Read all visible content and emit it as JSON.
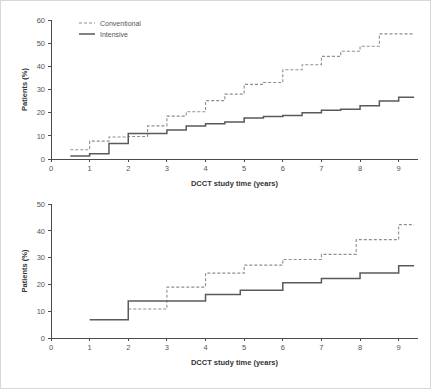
{
  "figure": {
    "background": "#ffffff",
    "border_color": "#d8d8d8",
    "axis_color": "#4a4a4a",
    "intensive_color": "#5a5a5a",
    "conventional_color": "#8e8e8e"
  },
  "legend": {
    "conventional_label": "Conventional",
    "intensive_label": "Intensive"
  },
  "chart_data": [
    {
      "id": "top",
      "type": "line",
      "title": "",
      "subtitle": "",
      "xlabel": "DCCT study time (years)",
      "ylabel": "Patients (%)",
      "xlim": [
        0,
        9.5
      ],
      "ylim": [
        0,
        60
      ],
      "xticks": [
        0,
        1,
        2,
        3,
        4,
        5,
        6,
        7,
        8,
        9
      ],
      "xticklabels": [
        "0",
        "1",
        "2",
        "3",
        "4",
        "5",
        "6",
        "7",
        "8",
        "9"
      ],
      "yticks": [
        0,
        10,
        20,
        30,
        40,
        50,
        60
      ],
      "yticklabels": [
        "0",
        "10",
        "20",
        "30",
        "40",
        "50",
        "60"
      ],
      "grid": false,
      "legend_position": "top-left",
      "annotations": [],
      "series": [
        {
          "name": "Conventional",
          "style": "dashed",
          "color": "#8e8e8e",
          "step": "post",
          "x": [
            0.5,
            1.0,
            1.5,
            2.0,
            2.5,
            3.0,
            3.5,
            4.0,
            4.5,
            5.0,
            5.5,
            6.0,
            6.5,
            7.0,
            7.5,
            8.0,
            8.5,
            9.0,
            9.4
          ],
          "y": [
            4.0,
            7.7,
            9.5,
            9.7,
            14.3,
            18.5,
            20.4,
            25.2,
            28.0,
            32.2,
            33.0,
            38.5,
            40.7,
            44.3,
            46.5,
            48.7,
            54.0,
            54.0,
            54.0
          ]
        },
        {
          "name": "Intensive",
          "style": "solid",
          "color": "#5a5a5a",
          "step": "post",
          "x": [
            0.5,
            1.0,
            1.5,
            2.0,
            2.5,
            3.0,
            3.5,
            4.0,
            4.5,
            5.0,
            5.5,
            6.0,
            6.5,
            7.0,
            7.5,
            8.0,
            8.5,
            9.0,
            9.4
          ],
          "y": [
            1.3,
            2.3,
            6.7,
            11.0,
            11.0,
            12.5,
            14.2,
            15.2,
            16.0,
            17.7,
            18.3,
            18.8,
            20.0,
            21.0,
            21.5,
            23.0,
            25.0,
            26.7,
            26.7
          ]
        }
      ]
    },
    {
      "id": "bottom",
      "type": "line",
      "title": "",
      "subtitle": "",
      "xlabel": "DCCT study time (years)",
      "ylabel": "Patients (%)",
      "xlim": [
        0,
        9.5
      ],
      "ylim": [
        0,
        50
      ],
      "xticks": [
        0,
        1,
        2,
        3,
        4,
        5,
        6,
        7,
        8,
        9
      ],
      "xticklabels": [
        "0",
        "1",
        "2",
        "3",
        "4",
        "5",
        "6",
        "7",
        "8",
        "9"
      ],
      "yticks": [
        0,
        10,
        20,
        30,
        40,
        50
      ],
      "yticklabels": [
        "0",
        "10",
        "20",
        "30",
        "40",
        "50"
      ],
      "grid": false,
      "legend_position": "none",
      "annotations": [],
      "series": [
        {
          "name": "Conventional",
          "style": "dashed",
          "color": "#8e8e8e",
          "step": "post",
          "x": [
            2.0,
            3.0,
            4.0,
            5.0,
            6.0,
            7.0,
            7.9,
            9.0,
            9.4
          ],
          "y": [
            10.8,
            19.0,
            24.2,
            27.2,
            29.3,
            31.2,
            36.7,
            42.3,
            42.3
          ]
        },
        {
          "name": "Intensive",
          "style": "solid",
          "color": "#5a5a5a",
          "step": "post",
          "x": [
            1.0,
            2.0,
            4.0,
            4.9,
            6.0,
            7.0,
            8.0,
            9.0,
            9.4
          ],
          "y": [
            6.8,
            13.8,
            16.2,
            17.8,
            20.6,
            22.2,
            24.3,
            27.0,
            27.0
          ]
        }
      ]
    }
  ]
}
